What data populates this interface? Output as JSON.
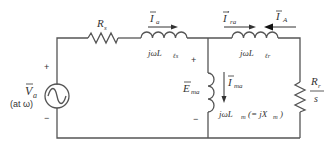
{
  "diagram": {
    "type": "induction-motor-equivalent-circuit",
    "source": {
      "label": "V̅a",
      "label_main": "V",
      "label_sub": "a",
      "frequency_note": "(at ω)",
      "plus": "+",
      "minus": "−"
    },
    "stator_resistance": {
      "main": "R",
      "sub": "s"
    },
    "stator_leakage": {
      "prefix": "jωL",
      "sub": "ℓs"
    },
    "stator_current": {
      "main": "I",
      "sub": "a"
    },
    "rotor_current_referred": {
      "main": "I",
      "sup": "′",
      "sub": "ra"
    },
    "rotor_current": {
      "main": "I",
      "sub": "A"
    },
    "rotor_leakage": {
      "prefix": "jωL",
      "sub": "ℓr"
    },
    "airgap_emf": {
      "main": "E",
      "sub": "ma",
      "plus": "+",
      "minus": "−"
    },
    "magnetizing_current": {
      "main": "I",
      "sub": "ma"
    },
    "magnetizing_inductance": {
      "prefix": "jωL",
      "sub": "m",
      "equiv": "(= jX",
      "equiv_sub": "m",
      "equiv_close": ")"
    },
    "rotor_resistance": {
      "num_main": "R",
      "num_sub": "r",
      "den": "s"
    }
  }
}
